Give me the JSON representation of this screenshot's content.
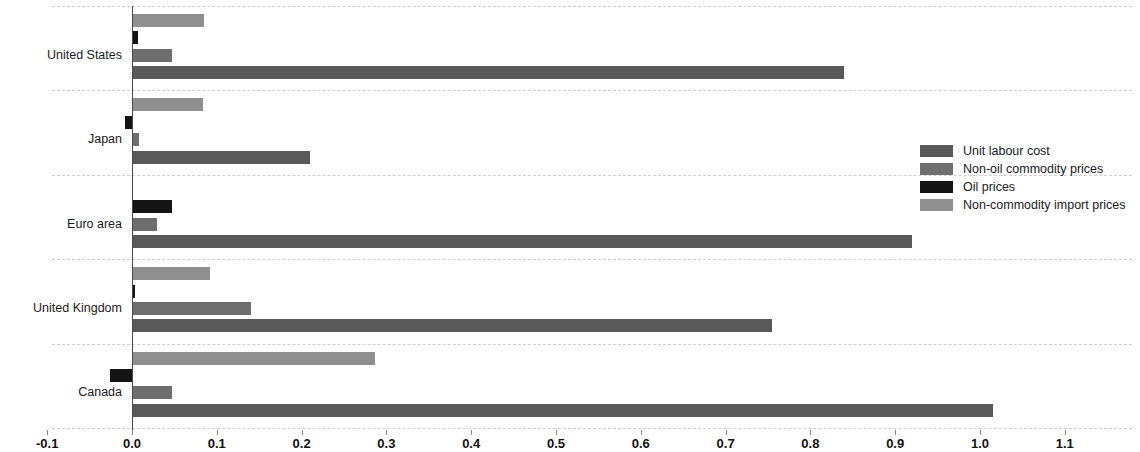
{
  "chart_data": {
    "type": "bar",
    "orientation": "horizontal",
    "title": "",
    "xlabel": "",
    "ylabel": "",
    "xlim": [
      -0.1,
      1.1
    ],
    "grid": true,
    "legend_position": "right",
    "categories": [
      "United States",
      "Japan",
      "Euro area",
      "United Kingdom",
      "Canada"
    ],
    "xticks": [
      "-0.1",
      "0.0",
      "0.1",
      "0.2",
      "0.3",
      "0.4",
      "0.5",
      "0.6",
      "0.7",
      "0.8",
      "0.9",
      "1.0",
      "1.1"
    ],
    "xtick_values": [
      -0.1,
      0.0,
      0.1,
      0.2,
      0.3,
      0.4,
      0.5,
      0.6,
      0.7,
      0.8,
      0.9,
      1.0,
      1.1
    ],
    "series": [
      {
        "name": "Unit labour cost",
        "color": "#595959",
        "values": [
          0.84,
          0.21,
          0.92,
          0.755,
          1.015
        ]
      },
      {
        "name": "Non-oil commodity prices",
        "color": "#6e6e6e",
        "values": [
          0.047,
          0.008,
          0.029,
          0.14,
          0.047
        ]
      },
      {
        "name": "Oil prices",
        "color": "#141414",
        "values": [
          0.007,
          -0.008,
          0.047,
          0.003,
          -0.026
        ]
      },
      {
        "name": "Non-commodity import prices",
        "color": "#8f8f8f",
        "values": [
          0.085,
          0.084,
          0.0,
          0.092,
          0.286
        ]
      }
    ]
  },
  "legend": {
    "items": [
      {
        "label": "Unit labour cost",
        "color": "#595959"
      },
      {
        "label": "Non-oil commodity prices",
        "color": "#6e6e6e"
      },
      {
        "label": "Oil prices",
        "color": "#141414"
      },
      {
        "label": "Non-commodity import prices",
        "color": "#8f8f8f"
      }
    ]
  }
}
